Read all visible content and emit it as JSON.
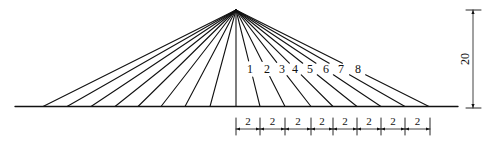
{
  "diagram": {
    "type": "cable-stayed fan diagram",
    "apex": {
      "x": 236,
      "y": 10
    },
    "ground": {
      "y": 106.5,
      "x1": 15,
      "x2": 458
    },
    "colors": {
      "line": "#111111",
      "background": "#ffffff"
    },
    "left_cable_feet": [
      43,
      67,
      91,
      115,
      138,
      161,
      185,
      210
    ],
    "center_cable_foot": 236,
    "right_cables": [
      {
        "label": "1",
        "foot": 260,
        "label_x": 250,
        "label_y": 73
      },
      {
        "label": "2",
        "foot": 285,
        "label_x": 267,
        "label_y": 73
      },
      {
        "label": "3",
        "foot": 311,
        "label_x": 282,
        "label_y": 73
      },
      {
        "label": "4",
        "foot": 333,
        "label_x": 295,
        "label_y": 73
      },
      {
        "label": "5",
        "foot": 357,
        "label_x": 310,
        "label_y": 73
      },
      {
        "label": "6",
        "foot": 381,
        "label_x": 326,
        "label_y": 73
      },
      {
        "label": "7",
        "foot": 405,
        "label_x": 341,
        "label_y": 73
      },
      {
        "label": "8",
        "foot": 429,
        "label_x": 358,
        "label_y": 73
      }
    ],
    "horizontal_dimension": {
      "y": 129,
      "ticks": [
        236,
        260,
        285,
        311,
        333,
        357,
        381,
        405,
        430
      ],
      "labels": [
        "2",
        "2",
        "2",
        "2",
        "2",
        "2",
        "2",
        "2"
      ]
    },
    "vertical_dimension": {
      "x": 473,
      "y_top": 10,
      "y_bottom": 108,
      "label": "20"
    }
  }
}
